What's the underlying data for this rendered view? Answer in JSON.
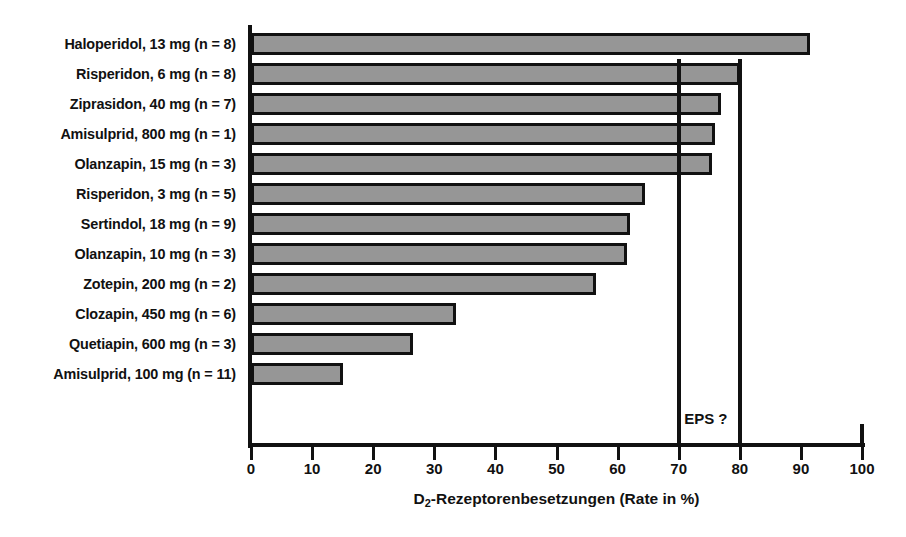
{
  "chart_data": {
    "type": "bar",
    "orientation": "horizontal",
    "title": "",
    "xlabel": "D2-Rezeptorenbesetzungen (Rate in %)",
    "xlabel_base": "D",
    "xlabel_sub": "2",
    "xlabel_rest": "-Rezeptorenbesetzungen (Rate in %)",
    "ylabel": "",
    "xlim": [
      0,
      100
    ],
    "xticks": [
      0,
      10,
      20,
      30,
      40,
      50,
      60,
      70,
      80,
      90,
      100
    ],
    "xtick_labels": [
      "0",
      "10",
      "20",
      "30",
      "40",
      "50",
      "60",
      "70",
      "80",
      "90",
      "100"
    ],
    "grid": false,
    "legend": false,
    "bar_color": "#969696",
    "bar_edge_color": "#111111",
    "categories": [
      "Haloperidol, 13 mg (n = 8)",
      "Risperidon, 6 mg (n = 8)",
      "Ziprasidon, 40 mg (n = 7)",
      "Amisulprid, 800 mg (n = 1)",
      "Olanzapin, 15 mg (n = 3)",
      "Risperidon, 3 mg (n = 5)",
      "Sertindol, 18 mg (n = 9)",
      "Olanzapin, 10 mg (n = 3)",
      "Zotepin, 200 mg (n = 2)",
      "Clozapin, 450 mg (n = 6)",
      "Quetiapin, 600 mg (n = 3)",
      "Amisulprid, 100 mg (n = 11)"
    ],
    "values": [
      91.5,
      80.0,
      77.0,
      76.0,
      75.5,
      64.5,
      62.0,
      61.5,
      56.5,
      33.5,
      26.5,
      15.0
    ],
    "annotations": [
      {
        "text": "EPS ?",
        "x": 74.5,
        "note": "between the 70 % and 80 % reference lines"
      }
    ],
    "reference_lines": [
      {
        "value": 70,
        "color": "#111111"
      },
      {
        "value": 80,
        "color": "#111111"
      }
    ]
  }
}
